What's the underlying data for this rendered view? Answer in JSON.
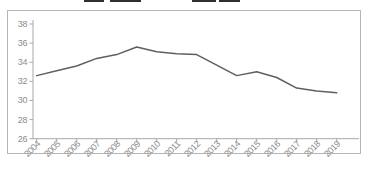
{
  "chart_data": {
    "type": "line",
    "title": "",
    "xlabel": "",
    "ylabel": "",
    "x": [
      2004,
      2005,
      2006,
      2007,
      2008,
      2009,
      2010,
      2011,
      2012,
      2013,
      2014,
      2015,
      2016,
      2017,
      2018,
      2019
    ],
    "values": [
      32.6,
      33.1,
      33.6,
      34.4,
      34.8,
      35.6,
      35.1,
      34.9,
      34.8,
      33.7,
      32.6,
      33.0,
      32.4,
      31.3,
      31.0,
      30.8
    ],
    "yticks": [
      26,
      28,
      30,
      32,
      34,
      36,
      38
    ],
    "ylim": [
      26,
      38
    ],
    "grid": false,
    "legend": null,
    "line_color": "#5f5f5f",
    "axis_color": "#a8a8a8",
    "tick_label_color": "#8c8c8c",
    "frame_color": "#b5b5b5"
  },
  "top_edge_artifacts": [
    {
      "left": 84,
      "width": 20
    },
    {
      "left": 110,
      "width": 31
    },
    {
      "left": 192,
      "width": 24
    },
    {
      "left": 219,
      "width": 21
    }
  ]
}
